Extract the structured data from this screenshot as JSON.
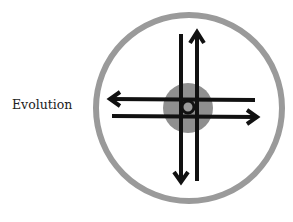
{
  "diagram": {
    "label": "Evolution",
    "colors": {
      "ring": "#9a9a9a",
      "core": "#8f8f8f",
      "arrows": "#111111",
      "background": "#ffffff"
    },
    "elements": [
      {
        "type": "ring",
        "cx": 189,
        "cy": 108,
        "r": 93
      },
      {
        "type": "core-disc",
        "cx": 188,
        "cy": 108,
        "r": 25
      },
      {
        "type": "center-circle",
        "cx": 188,
        "cy": 107,
        "r": 6
      },
      {
        "type": "arrow",
        "direction": "down",
        "x": 181
      },
      {
        "type": "arrow",
        "direction": "up",
        "x": 197
      },
      {
        "type": "arrow",
        "direction": "left",
        "y": 99
      },
      {
        "type": "arrow",
        "direction": "right",
        "y": 117
      }
    ]
  }
}
